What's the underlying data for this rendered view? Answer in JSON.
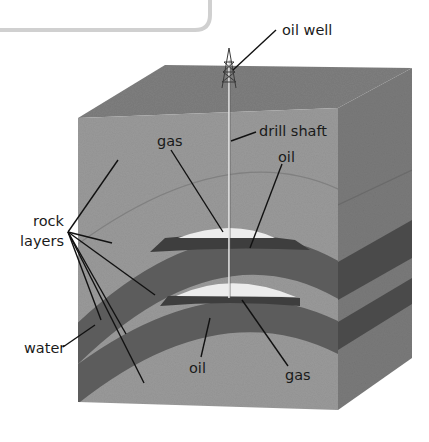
{
  "diagram": {
    "type": "geological cross-section block",
    "colors": {
      "top_face": "#7e7e7e",
      "front_face": "#9a9a9a",
      "side_face": "#7a7a7a",
      "dark_layer": "#5c5c5c",
      "dark_layer_side": "#4a4a4a",
      "oil": "#3e3e3e",
      "gas": "#ececec",
      "faint_line": "#808080",
      "callout_box_border": "#cfcfcf"
    },
    "labels": {
      "oil_well": "oil well",
      "drill_shaft": "drill shaft",
      "gas_upper": "gas",
      "oil_upper": "oil",
      "rock_layers_line1": "rock",
      "rock_layers_line2": "layers",
      "water": "water",
      "oil_lower": "oil",
      "gas_lower": "gas"
    }
  }
}
